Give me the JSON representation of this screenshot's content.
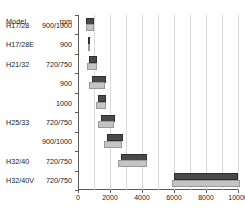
{
  "table": {
    "header_model": "Model",
    "header_rpm": "rpm",
    "rows": [
      {
        "model": "H17/28",
        "rpm": "900/1000"
      },
      {
        "model": "H17/28E",
        "rpm": "900"
      },
      {
        "model": "H21/32",
        "rpm": "720/750"
      },
      {
        "model": "",
        "rpm": "900"
      },
      {
        "model": "",
        "rpm": "1000"
      },
      {
        "model": "H25/33",
        "rpm": "720/750"
      },
      {
        "model": "",
        "rpm": "900/1000"
      },
      {
        "model": "H32/40",
        "rpm": "720/750"
      },
      {
        "model": "H32/40V",
        "rpm": "720/750"
      }
    ]
  },
  "axis": {
    "ticks": [
      0,
      2000,
      4000,
      6000,
      8000,
      10000
    ],
    "tick_labels": [
      "0",
      "2000",
      "4000",
      "6000",
      "8000",
      "10000"
    ],
    "min": 0,
    "max": 10000,
    "gridline_step": 1000
  },
  "colors": {
    "bar_dark": "#4a4a4a",
    "bar_light": "#c4c4c4",
    "gridline": "#d9d9d9",
    "axis": "#5a5a5a",
    "background": "#ffffff",
    "text": "#1a1a1a"
  },
  "chart_data": {
    "type": "bar",
    "orientation": "horizontal",
    "title": "",
    "xlabel": "",
    "ylabel": "",
    "xlim": [
      0,
      10000
    ],
    "grid": true,
    "legend": "none",
    "categories": [
      "H17/28 900/1000",
      "H17/28E 900",
      "H21/32 720/750",
      "H21/32 900",
      "H21/32 1000",
      "H25/33 720/750",
      "H25/33 900/1000",
      "H32/40 720/750",
      "H32/40V 720/750"
    ],
    "series": [
      {
        "name": "dark-range",
        "kind": "range",
        "values": [
          {
            "start": 520,
            "end": 1000
          },
          {
            "start": 600,
            "end": 660
          },
          {
            "start": 690,
            "end": 1210
          },
          {
            "start": 880,
            "end": 1720
          },
          {
            "start": 1250,
            "end": 1780
          },
          {
            "start": 1420,
            "end": 2290
          },
          {
            "start": 1800,
            "end": 2830
          },
          {
            "start": 2700,
            "end": 4300
          },
          {
            "start": 6000,
            "end": 10000
          }
        ]
      },
      {
        "name": "light-range",
        "kind": "range",
        "values": [
          {
            "start": 520,
            "end": 1020
          },
          {
            "start": 600,
            "end": 660
          },
          {
            "start": 560,
            "end": 1180
          },
          {
            "start": 690,
            "end": 1660
          },
          {
            "start": 1130,
            "end": 1740
          },
          {
            "start": 1250,
            "end": 2230
          },
          {
            "start": 1620,
            "end": 2780
          },
          {
            "start": 2500,
            "end": 4320
          },
          {
            "start": 5900,
            "end": 10100
          }
        ]
      }
    ]
  }
}
